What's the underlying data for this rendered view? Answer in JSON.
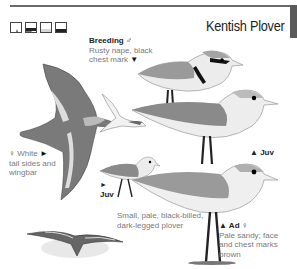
{
  "header": {
    "title": "Kentish Plover",
    "habitat_icons": [
      "coast-mudflat-icon",
      "shore-icon",
      "saltmarsh-icon",
      "sea-waves-icon"
    ]
  },
  "labels": {
    "breeding_male": {
      "heading": "Breeding",
      "sex_symbol": "♂",
      "text_line1": "Rusty nape, black",
      "text_line2": "chest mark",
      "pointer": "▼"
    },
    "female_flight": {
      "sex_symbol": "♀",
      "text_line1": "White",
      "pointer": "►",
      "text_line2": "tail sides and",
      "text_line3": "wingbar"
    },
    "juv_right": {
      "pointer": "▲",
      "text": "Juv"
    },
    "juv_left": {
      "pointer": "►",
      "text": "Juv"
    },
    "summary": {
      "line1": "Small, pale, black-billed,",
      "line2": "dark-legged plover"
    },
    "adult_female": {
      "pointer": "▲",
      "heading": "Ad",
      "sex_symbol": "♀",
      "text_line1": "Pale sandy; face",
      "text_line2": "and chest marks",
      "text_line3": "brown"
    }
  },
  "colors": {
    "border": "#5a5a5a",
    "label_text": "#7a7a7a",
    "heading_text": "#222222"
  }
}
